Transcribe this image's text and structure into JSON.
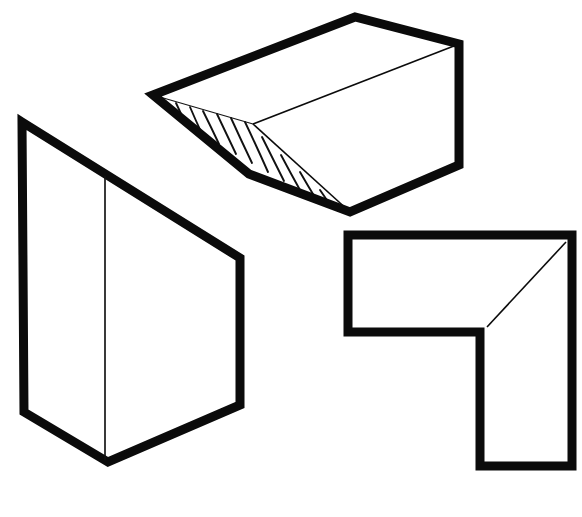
{
  "figure": {
    "canvas_width": 582,
    "canvas_height": 517,
    "background_color": "#ffffff",
    "heavy_stroke_color": "#0b0b0b",
    "light_stroke_color": "#151515",
    "heavy_stroke_width": 9,
    "light_stroke_width": 1.6,
    "shapes": [
      {
        "id": "top-wedge-block",
        "label": "Wedge block with ribbed chamfer face",
        "position": "top-center",
        "outline_path": "M 153 95 L 355 17 L 459 44 L 459 165 L 350 212 L 249 174 Z",
        "light_edges": [
          "M 459 44 L 253 124",
          "M 253 124 L 350 212",
          "M 153 95 L 253 124"
        ],
        "hatched_face": {
          "description": "ribbed chamfer with curved hatch lines",
          "hatch_count": 11,
          "apex": [
            153,
            95
          ],
          "upper_edge_end": [
            253,
            124
          ],
          "lower_edge_end": [
            350,
            212
          ]
        }
      },
      {
        "id": "left-angled-block",
        "label": "Block with angled top face",
        "position": "left",
        "outline_path": "M 22 122 L 240 258 L 240 405 L 108 462 L 24 412 Z",
        "light_edges": [
          "M 105 172 L 105 462",
          "M 24 412 L 108 462",
          "M 108 462 L 240 405",
          "M 22 122 L 105 172"
        ]
      },
      {
        "id": "right-l-block",
        "label": "L-shaped bracket with chamfered inner corner",
        "position": "bottom-right",
        "outline_path": "M 348 235 L 572 235 L 572 466 L 480 466 L 480 332 L 348 332 Z",
        "light_edges": [
          "M 566 241 L 487 327"
        ]
      }
    ]
  }
}
